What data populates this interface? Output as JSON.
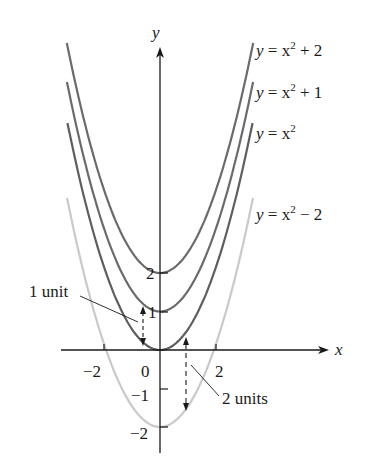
{
  "figure": {
    "axes": {
      "x_label": "x",
      "y_label": "y",
      "x_ticks": [
        {
          "value": -2,
          "label": "−2"
        },
        {
          "value": 0,
          "label": "0"
        },
        {
          "value": 2,
          "label": "2"
        }
      ],
      "y_ticks": [
        {
          "value": 2,
          "label": "2"
        },
        {
          "value": 1,
          "label": "1"
        },
        {
          "value": -1,
          "label": "−1"
        },
        {
          "value": -2,
          "label": "−2"
        }
      ]
    },
    "curves": [
      {
        "name": "x2-plus-2",
        "label_y": "y",
        "label_eq": " = x",
        "label_exp": "2",
        "label_tail": " + 2",
        "shift": 2,
        "color": "#6b6b6b"
      },
      {
        "name": "x2-plus-1",
        "label_y": "y",
        "label_eq": " = x",
        "label_exp": "2",
        "label_tail": " + 1",
        "shift": 1,
        "color": "#6b6b6b"
      },
      {
        "name": "x2",
        "label_y": "y",
        "label_eq": " = x",
        "label_exp": "2",
        "label_tail": "",
        "shift": 0,
        "color": "#5e5e5e"
      },
      {
        "name": "x2-minus-2",
        "label_y": "y",
        "label_eq": " = x",
        "label_exp": "2",
        "label_tail": " − 2",
        "shift": -2,
        "color": "#c9c9c9"
      }
    ],
    "annotations": {
      "one_unit": "1 unit",
      "two_units": "2 units"
    }
  }
}
